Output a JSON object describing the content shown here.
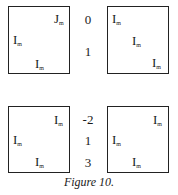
{
  "figure": {
    "caption": "Figure 10.",
    "top_row": {
      "left_matrix": {
        "blocks": [
          {
            "letter": "J",
            "sub": "m"
          },
          {
            "letter": "I",
            "sub": "m"
          },
          {
            "letter": "I",
            "sub": "m"
          }
        ]
      },
      "labels": [
        "0",
        "1"
      ],
      "right_matrix": {
        "blocks": [
          {
            "letter": "I",
            "sub": "m"
          },
          {
            "letter": "I",
            "sub": "m"
          },
          {
            "letter": "I",
            "sub": "m"
          }
        ]
      }
    },
    "bottom_row": {
      "left_matrix": {
        "blocks": [
          {
            "letter": "I",
            "sub": "m"
          },
          {
            "letter": "I",
            "sub": "m"
          },
          {
            "letter": "I",
            "sub": "m"
          }
        ]
      },
      "labels": [
        "-2",
        "1",
        "3"
      ],
      "right_matrix": {
        "blocks": [
          {
            "letter": "I",
            "sub": "m"
          },
          {
            "letter": "I",
            "sub": "m"
          },
          {
            "letter": "I",
            "sub": "m"
          }
        ]
      }
    }
  }
}
